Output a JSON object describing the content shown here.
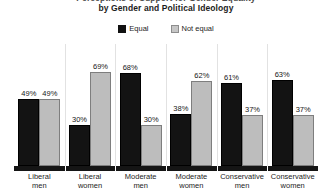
{
  "chart_data": {
    "type": "bar",
    "title": "Perceptions of Support for Gender Equality\nby Gender and Political Ideology",
    "title_lines": [
      "Perceptions of Support for Gender Equality",
      "by Gender and Political Ideology"
    ],
    "xlabel": "",
    "ylabel": "",
    "ylim": [
      0,
      100
    ],
    "grid": false,
    "legend_position": "top-center",
    "categories": [
      "Liberal men",
      "Liberal women",
      "Moderate men",
      "Moderate women",
      "Conservative men",
      "Conservative women"
    ],
    "category_lines": [
      [
        "Liberal",
        "men"
      ],
      [
        "Liberal",
        "women"
      ],
      [
        "Moderate",
        "men"
      ],
      [
        "Moderate",
        "women"
      ],
      [
        "Conservative",
        "men"
      ],
      [
        "Conservative",
        "women"
      ]
    ],
    "series": [
      {
        "name": "Equal",
        "color": "#131313",
        "values": [
          49,
          30,
          68,
          38,
          61,
          63
        ],
        "labels": [
          "49%",
          "30%",
          "68%",
          "38%",
          "61%",
          "63%"
        ]
      },
      {
        "name": "Not equal",
        "color": "#bdbdbd",
        "values": [
          49,
          69,
          30,
          62,
          37,
          37
        ],
        "labels": [
          "49%",
          "69%",
          "30%",
          "62%",
          "37%",
          "37%"
        ]
      }
    ]
  },
  "legend": {
    "items": [
      {
        "label": "Equal",
        "swatch": "equal"
      },
      {
        "label": "Not equal",
        "swatch": "notequal"
      }
    ]
  },
  "colors": {
    "equal": "#131313",
    "not_equal": "#bdbdbd",
    "axis": "#151515",
    "background": "#ffffff"
  }
}
